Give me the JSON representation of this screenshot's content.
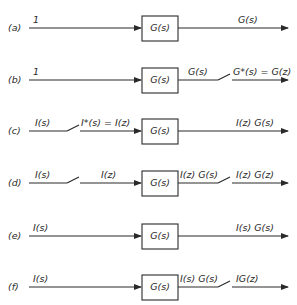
{
  "rows": [
    {
      "id": "a",
      "label": "(a)",
      "input": "1",
      "block": "G(s)",
      "mid": "",
      "output": "G(s)",
      "sampler_before": false,
      "sampler_after": false
    },
    {
      "id": "b",
      "label": "(b)",
      "input": "1",
      "block": "G(s)",
      "mid": "G(s)",
      "output": "G*(s) = G(z)",
      "sampler_before": false,
      "sampler_after": true
    },
    {
      "id": "c",
      "label": "(c)",
      "input": "I(s)",
      "block": "G(s)",
      "pre": "I*(s) = I(z)",
      "output": "I(z) G(s)",
      "sampler_before": true,
      "sampler_after": false
    },
    {
      "id": "d",
      "label": "(d)",
      "input": "I(s)",
      "block": "G(s)",
      "pre": "I(z)",
      "mid": "I(z) G(s)",
      "output": "I(z) G(z)",
      "sampler_before": true,
      "sampler_after": true
    },
    {
      "id": "e",
      "label": "(e)",
      "input": "I(s)",
      "block": "G(s)",
      "mid": "",
      "output": "I(s) G(s)",
      "sampler_before": false,
      "sampler_after": false
    },
    {
      "id": "f",
      "label": "(f)",
      "input": "I(s)",
      "block": "G(s)",
      "mid": "I(s) G(s)",
      "output": "IG(z)",
      "sampler_before": false,
      "sampler_after": true
    }
  ]
}
